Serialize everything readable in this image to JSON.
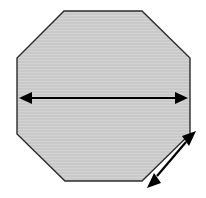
{
  "figure": {
    "background_color": "#ffffff",
    "width": 206,
    "height": 198
  },
  "shape": {
    "name": "octagon",
    "sides": 8,
    "fill_color": "#c8c8c8",
    "outline_color": "#2b2b2b",
    "outline_width": 1.4,
    "texture": "horizontal-scanlines",
    "texture_color": "#d2d2d2",
    "vertices": [
      [
        64,
        11
      ],
      [
        142,
        11
      ],
      [
        190,
        58
      ],
      [
        190,
        134
      ],
      [
        142,
        181
      ],
      [
        65,
        181
      ],
      [
        17,
        134
      ],
      [
        17,
        58
      ]
    ],
    "points_attr": "64,11 142,11 190,58 190,134 142,181 65,181 17,134 17,58"
  },
  "dimensions": [
    {
      "name": "width-dimension",
      "label": "",
      "orientation": "horizontal",
      "double_headed": true,
      "color": "#000000",
      "line_width": 2.2,
      "start": [
        19,
        98
      ],
      "end": [
        188,
        98
      ],
      "head_length": 13,
      "head_half_width": 6
    },
    {
      "name": "side-length-dimension",
      "label": "",
      "orientation": "diagonal",
      "double_headed": true,
      "color": "#000000",
      "line_width": 2.2,
      "start": [
        147,
        188
      ],
      "end": [
        196,
        131
      ],
      "head_length": 14,
      "head_half_width": 6
    }
  ],
  "arrow_geometry": {
    "horizontal_line_x1": 30,
    "horizontal_line_x2": 177,
    "horizontal_line_y": 98,
    "horizontal_left_head": "19,98 32,92 32,104",
    "horizontal_right_head": "188,98 175,92 175,104",
    "diagonal_line_x1": 157,
    "diagonal_line_y1": 176,
    "diagonal_line_x2": 186,
    "diagonal_line_y2": 142,
    "diagonal_lower_head": "147,188 161,183 154,173",
    "diagonal_upper_head": "196,131 182,136 189,146"
  }
}
